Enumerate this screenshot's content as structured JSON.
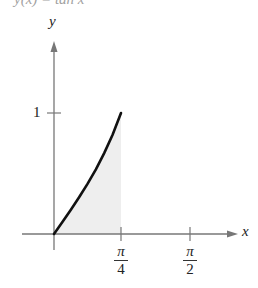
{
  "header": {
    "fragment": "y(x) = tan x"
  },
  "chart_data": {
    "type": "area",
    "title": "",
    "function": "y = tan x",
    "xlabel": "x",
    "ylabel": "y",
    "xlim": [
      0,
      1.82
    ],
    "ylim": [
      0,
      1.6
    ],
    "grid": false,
    "legend": null,
    "x_ticks": [
      {
        "value": 0.7854,
        "label_num": "π",
        "label_den": "4"
      },
      {
        "value": 1.5708,
        "label_num": "π",
        "label_den": "2"
      }
    ],
    "y_ticks": [
      {
        "value": 1,
        "label": "1"
      }
    ],
    "series": [
      {
        "name": "tan x",
        "x": [
          0,
          0.0982,
          0.1963,
          0.2945,
          0.3927,
          0.4909,
          0.589,
          0.6872,
          0.7854
        ],
        "values": [
          0,
          0.0985,
          0.1989,
          0.3033,
          0.4142,
          0.5345,
          0.6682,
          0.8207,
          1.0
        ]
      }
    ],
    "shaded_region": {
      "from_x": 0,
      "to_x": 0.7854,
      "under": "tan x",
      "color": "#eeeeee"
    },
    "colors": {
      "curve": "#111111",
      "axes": "#777777",
      "shade": "#eeeeee"
    }
  }
}
